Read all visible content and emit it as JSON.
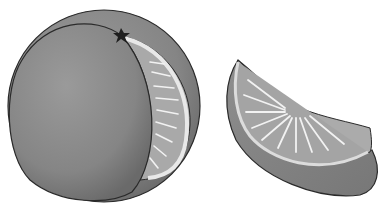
{
  "image": {
    "description": "Grayscale illustration of an orange with a wedge partially cut, and a separate orange wedge",
    "colors": {
      "background": "#ffffff",
      "peel": "#8a8a8a",
      "peel_dark": "#6e6e6e",
      "flesh": "#a8a8a8",
      "pith": "#e6e6e6",
      "outline": "#2a2a2a"
    }
  }
}
